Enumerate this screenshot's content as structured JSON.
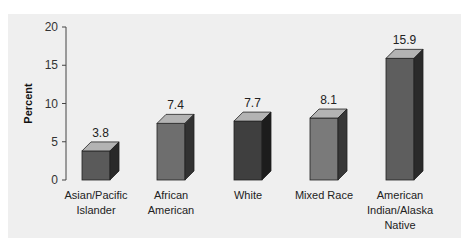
{
  "chart_data": {
    "type": "bar",
    "title": "",
    "xlabel": "",
    "ylabel": "Percent",
    "ylim": [
      0,
      20
    ],
    "yticks": [
      0,
      5,
      10,
      15,
      20
    ],
    "grid": false,
    "legend": null,
    "style": "3d-bars",
    "categories": [
      "Asian/Pacific Islander",
      "African American",
      "White",
      "Mixed Race",
      "American Indian/Alaska Native"
    ],
    "category_lines": [
      [
        "Asian/Pacific",
        "Islander"
      ],
      [
        "African",
        "American"
      ],
      [
        "White"
      ],
      [
        "Mixed Race"
      ],
      [
        "American",
        "Indian/Alaska",
        "Native"
      ]
    ],
    "values": [
      3.8,
      7.4,
      7.7,
      8.1,
      15.9
    ],
    "value_labels": [
      "3.8",
      "7.4",
      "7.7",
      "8.1",
      "15.9"
    ],
    "colors": [
      "#5a5a5a",
      "#6e6e6e",
      "#3f3f3f",
      "#7a7a7a",
      "#5e5e5e"
    ]
  }
}
